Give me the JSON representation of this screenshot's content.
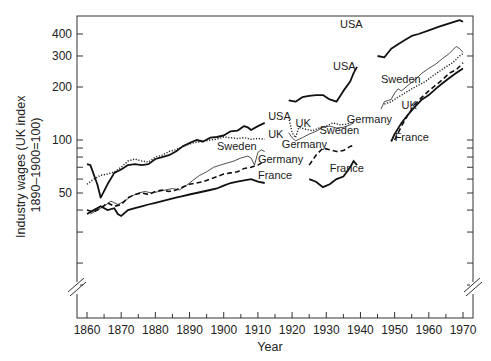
{
  "chart_data": {
    "type": "line",
    "title": "",
    "xlabel": "Year",
    "ylabel": "Industry wages (UK index\n1890–1900=100)",
    "ylabel_lines": [
      "Industry wages (UK index",
      "1890–1900=100)"
    ],
    "yscale": "log",
    "ylim": [
      20,
      480
    ],
    "xlim": [
      1857,
      1972
    ],
    "x_ticks": [
      1860,
      1870,
      1880,
      1890,
      1900,
      1910,
      1920,
      1930,
      1940,
      1950,
      1960,
      1970
    ],
    "y_tick_labels": [
      50,
      100,
      200,
      300,
      400
    ],
    "y_minor_ticks": [
      30,
      40,
      60,
      70,
      80,
      90
    ],
    "axis_break": true,
    "grid": false,
    "legend": "inline labels",
    "series": [
      {
        "name": "USA",
        "style": "solid-thick",
        "segments": [
          [
            [
              1860,
              73
            ],
            [
              1861,
              72
            ],
            [
              1863,
              56
            ],
            [
              1864,
              47
            ],
            [
              1866,
              56
            ],
            [
              1868,
              65
            ],
            [
              1870,
              68
            ],
            [
              1872,
              72
            ],
            [
              1874,
              73
            ],
            [
              1876,
              72
            ],
            [
              1878,
              73
            ],
            [
              1880,
              78
            ],
            [
              1882,
              80
            ],
            [
              1884,
              82
            ],
            [
              1886,
              86
            ],
            [
              1888,
              92
            ],
            [
              1890,
              96
            ],
            [
              1892,
              100
            ],
            [
              1894,
              98
            ],
            [
              1896,
              103
            ],
            [
              1898,
              104
            ],
            [
              1900,
              106
            ],
            [
              1902,
              112
            ],
            [
              1904,
              113
            ],
            [
              1906,
              120
            ],
            [
              1907,
              118
            ],
            [
              1908,
              114
            ],
            [
              1910,
              120
            ],
            [
              1912,
              125
            ]
          ],
          [
            [
              1919,
              168
            ],
            [
              1921,
              165
            ],
            [
              1923,
              175
            ],
            [
              1925,
              178
            ],
            [
              1927,
              180
            ],
            [
              1929,
              180
            ],
            [
              1931,
              170
            ],
            [
              1933,
              165
            ],
            [
              1935,
              190
            ],
            [
              1937,
              215
            ],
            [
              1938,
              240
            ],
            [
              1939,
              260
            ]
          ],
          [
            [
              1945,
              300
            ],
            [
              1947,
              295
            ],
            [
              1949,
              330
            ],
            [
              1951,
              350
            ],
            [
              1953,
              370
            ],
            [
              1955,
              390
            ],
            [
              1957,
              400
            ],
            [
              1960,
              420
            ],
            [
              1963,
              440
            ],
            [
              1966,
              460
            ],
            [
              1969,
              480
            ],
            [
              1970,
              470
            ]
          ]
        ]
      },
      {
        "name": "UK",
        "style": "dotted",
        "segments": [
          [
            [
              1860,
              56
            ],
            [
              1862,
              60
            ],
            [
              1864,
              63
            ],
            [
              1866,
              64
            ],
            [
              1868,
              66
            ],
            [
              1870,
              70
            ],
            [
              1872,
              76
            ],
            [
              1874,
              78
            ],
            [
              1876,
              76
            ],
            [
              1878,
              75
            ],
            [
              1880,
              80
            ],
            [
              1882,
              82
            ],
            [
              1884,
              86
            ],
            [
              1886,
              88
            ],
            [
              1888,
              92
            ],
            [
              1890,
              95
            ],
            [
              1892,
              97
            ],
            [
              1894,
              98
            ],
            [
              1896,
              100
            ],
            [
              1898,
              101
            ],
            [
              1900,
              104
            ],
            [
              1902,
              103
            ],
            [
              1904,
              102
            ],
            [
              1906,
              103
            ],
            [
              1908,
              101
            ],
            [
              1910,
              102
            ],
            [
              1912,
              101
            ]
          ],
          [
            [
              1919,
              135
            ],
            [
              1920,
              110
            ],
            [
              1921,
              103
            ],
            [
              1922,
              118
            ],
            [
              1924,
              115
            ],
            [
              1926,
              113
            ],
            [
              1928,
              117
            ],
            [
              1930,
              120
            ],
            [
              1932,
              125
            ],
            [
              1934,
              122
            ],
            [
              1936,
              123
            ],
            [
              1938,
              127
            ]
          ],
          [
            [
              1947,
              160
            ],
            [
              1949,
              165
            ],
            [
              1951,
              175
            ],
            [
              1953,
              185
            ],
            [
              1955,
              195
            ],
            [
              1957,
              205
            ],
            [
              1959,
              215
            ],
            [
              1961,
              230
            ],
            [
              1963,
              245
            ],
            [
              1965,
              260
            ],
            [
              1967,
              275
            ],
            [
              1969,
              300
            ],
            [
              1970,
              310
            ]
          ]
        ]
      },
      {
        "name": "Sweden",
        "style": "solid-thin",
        "segments": [
          [
            [
              1861,
              38
            ],
            [
              1863,
              40
            ],
            [
              1865,
              42
            ],
            [
              1867,
              45
            ],
            [
              1869,
              43
            ],
            [
              1871,
              45
            ],
            [
              1873,
              48
            ],
            [
              1875,
              50
            ],
            [
              1877,
              51
            ],
            [
              1879,
              50
            ],
            [
              1881,
              51
            ],
            [
              1883,
              52
            ],
            [
              1885,
              53
            ],
            [
              1887,
              52
            ],
            [
              1889,
              55
            ],
            [
              1891,
              59
            ],
            [
              1893,
              63
            ],
            [
              1895,
              66
            ],
            [
              1897,
              70
            ],
            [
              1899,
              72
            ],
            [
              1901,
              74
            ],
            [
              1903,
              76
            ],
            [
              1905,
              79
            ],
            [
              1906,
              80
            ],
            [
              1907,
              81
            ],
            [
              1908,
              79
            ],
            [
              1909,
              72
            ],
            [
              1910,
              85
            ],
            [
              1911,
              88
            ],
            [
              1912,
              86
            ]
          ],
          [
            [
              1919,
              110
            ],
            [
              1920,
              103
            ],
            [
              1921,
              99
            ],
            [
              1923,
              103
            ],
            [
              1925,
              108
            ],
            [
              1927,
              112
            ],
            [
              1929,
              118
            ],
            [
              1931,
              120
            ],
            [
              1933,
              117
            ],
            [
              1935,
              118
            ],
            [
              1937,
              122
            ],
            [
              1938,
              125
            ]
          ],
          [
            [
              1946,
              150
            ],
            [
              1947,
              165
            ],
            [
              1949,
              170
            ],
            [
              1950,
              185
            ],
            [
              1951,
              195
            ],
            [
              1952,
              190
            ],
            [
              1954,
              205
            ],
            [
              1956,
              220
            ],
            [
              1958,
              240
            ],
            [
              1960,
              255
            ],
            [
              1962,
              270
            ],
            [
              1964,
              290
            ],
            [
              1966,
              310
            ],
            [
              1968,
              340
            ],
            [
              1969,
              330
            ],
            [
              1970,
              315
            ]
          ]
        ]
      },
      {
        "name": "Germany",
        "style": "dashed",
        "segments": [
          [
            [
              1860,
              40
            ],
            [
              1862,
              39
            ],
            [
              1864,
              41
            ],
            [
              1866,
              44
            ],
            [
              1868,
              42
            ],
            [
              1870,
              43
            ],
            [
              1872,
              47
            ],
            [
              1874,
              49
            ],
            [
              1876,
              50
            ],
            [
              1878,
              49
            ],
            [
              1880,
              51
            ],
            [
              1882,
              52
            ],
            [
              1884,
              51
            ],
            [
              1886,
              52
            ],
            [
              1888,
              54
            ],
            [
              1890,
              56
            ],
            [
              1892,
              57
            ],
            [
              1894,
              58
            ],
            [
              1896,
              60
            ],
            [
              1898,
              62
            ],
            [
              1900,
              64
            ],
            [
              1902,
              65
            ],
            [
              1904,
              66
            ],
            [
              1906,
              69
            ],
            [
              1908,
              70
            ],
            [
              1910,
              72
            ],
            [
              1912,
              76
            ]
          ],
          [
            [
              1925,
              72
            ],
            [
              1927,
              82
            ],
            [
              1929,
              90
            ],
            [
              1931,
              88
            ],
            [
              1933,
              86
            ],
            [
              1935,
              87
            ],
            [
              1937,
              92
            ],
            [
              1938,
              93
            ]
          ],
          [
            [
              1950,
              100
            ],
            [
              1952,
              120
            ],
            [
              1954,
              140
            ],
            [
              1956,
              160
            ],
            [
              1958,
              175
            ],
            [
              1960,
              190
            ],
            [
              1962,
              205
            ],
            [
              1964,
              220
            ],
            [
              1966,
              240
            ],
            [
              1968,
              250
            ],
            [
              1970,
              275
            ]
          ]
        ]
      },
      {
        "name": "France",
        "style": "solid-thick",
        "segments": [
          [
            [
              1860,
              38
            ],
            [
              1862,
              40
            ],
            [
              1864,
              42
            ],
            [
              1866,
              40
            ],
            [
              1868,
              41
            ],
            [
              1869,
              38
            ],
            [
              1870,
              37
            ],
            [
              1872,
              40
            ],
            [
              1874,
              41
            ],
            [
              1876,
              42
            ],
            [
              1878,
              43
            ],
            [
              1880,
              44
            ],
            [
              1882,
              45
            ],
            [
              1884,
              46
            ],
            [
              1886,
              47
            ],
            [
              1888,
              48
            ],
            [
              1890,
              49
            ],
            [
              1892,
              50
            ],
            [
              1894,
              51
            ],
            [
              1896,
              52
            ],
            [
              1898,
              53
            ],
            [
              1900,
              55
            ],
            [
              1902,
              57
            ],
            [
              1904,
              58
            ],
            [
              1906,
              59
            ],
            [
              1908,
              60
            ],
            [
              1910,
              58
            ],
            [
              1912,
              57
            ]
          ],
          [
            [
              1925,
              60
            ],
            [
              1927,
              58
            ],
            [
              1929,
              54
            ],
            [
              1931,
              56
            ],
            [
              1933,
              60
            ],
            [
              1935,
              62
            ],
            [
              1937,
              70
            ],
            [
              1938,
              76
            ],
            [
              1939,
              72
            ]
          ],
          [
            [
              1949,
              98
            ],
            [
              1950,
              108
            ],
            [
              1952,
              125
            ],
            [
              1954,
              140
            ],
            [
              1956,
              155
            ],
            [
              1958,
              170
            ],
            [
              1960,
              180
            ],
            [
              1962,
              195
            ],
            [
              1964,
              210
            ],
            [
              1966,
              225
            ],
            [
              1968,
              240
            ],
            [
              1970,
              255
            ]
          ]
        ]
      }
    ],
    "annotations": [
      {
        "text": "USA",
        "x": 1913,
        "y": 130
      },
      {
        "text": "UK",
        "x": 1913,
        "y": 103
      },
      {
        "text": "Sweden",
        "x": 1898,
        "y": 88
      },
      {
        "text": "Germany",
        "x": 1910,
        "y": 74
      },
      {
        "text": "France",
        "x": 1910,
        "y": 60
      },
      {
        "text": "USA",
        "x": 1932,
        "y": 250
      },
      {
        "text": "UK",
        "x": 1921,
        "y": 118
      },
      {
        "text": "Sweden",
        "x": 1928,
        "y": 108
      },
      {
        "text": "Germany",
        "x": 1917,
        "y": 90
      },
      {
        "text": "France",
        "x": 1931,
        "y": 66
      },
      {
        "text": "USA",
        "x": 1934,
        "y": 430
      },
      {
        "text": "Sweden",
        "x": 1946,
        "y": 212
      },
      {
        "text": "UK",
        "x": 1952,
        "y": 150
      },
      {
        "text": "Germany",
        "x": 1936,
        "y": 125
      },
      {
        "text": "France",
        "x": 1950,
        "y": 99
      }
    ]
  }
}
